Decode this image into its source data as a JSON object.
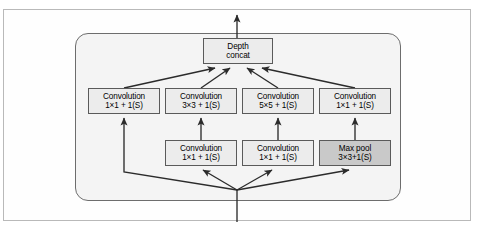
{
  "figure": {
    "colors": {
      "node_fill": "#ececec",
      "node_fill_dark": "#c9c9c9",
      "node_border": "#5a5a5a",
      "container_fill": "#f4f4f4",
      "container_border": "#6d6d6d",
      "frame_border": "#b9b9b9",
      "arrow": "#2b2b2b",
      "background": "#ffffff"
    }
  },
  "nodes": {
    "depth_concat": {
      "line1": "Depth",
      "line2": "concat",
      "style": "light"
    },
    "conv_1x1_a": {
      "line1": "Convolution",
      "line2": "1×1 + 1(S)",
      "style": "light"
    },
    "conv_3x3": {
      "line1": "Convolution",
      "line2": "3×3 + 1(S)",
      "style": "light"
    },
    "conv_5x5": {
      "line1": "Convolution",
      "line2": "5×5 + 1(S)",
      "style": "light"
    },
    "conv_1x1_b": {
      "line1": "Convolution",
      "line2": "1×1 + 1(S)",
      "style": "light"
    },
    "conv_1x1_c": {
      "line1": "Convolution",
      "line2": "1×1 + 1(S)",
      "style": "light"
    },
    "conv_1x1_d": {
      "line1": "Convolution",
      "line2": "1×1 + 1(S)",
      "style": "light"
    },
    "max_pool": {
      "line1": "Max pool",
      "line2": "3×3+1(S)",
      "style": "dark"
    }
  },
  "edges": [
    {
      "name": "input-to-junction",
      "from": "input",
      "to": "junction"
    },
    {
      "name": "junction-to-conv-1x1-a",
      "from": "junction",
      "to": "conv_1x1_a"
    },
    {
      "name": "junction-to-conv-1x1-c",
      "from": "junction",
      "to": "conv_1x1_c"
    },
    {
      "name": "junction-to-conv-1x1-d",
      "from": "junction",
      "to": "conv_1x1_d"
    },
    {
      "name": "junction-to-max-pool",
      "from": "junction",
      "to": "max_pool"
    },
    {
      "name": "conv-1x1-c-to-conv-3x3",
      "from": "conv_1x1_c",
      "to": "conv_3x3"
    },
    {
      "name": "conv-1x1-d-to-conv-5x5",
      "from": "conv_1x1_d",
      "to": "conv_5x5"
    },
    {
      "name": "max-pool-to-conv-1x1-b",
      "from": "max_pool",
      "to": "conv_1x1_b"
    },
    {
      "name": "conv-1x1-a-to-concat",
      "from": "conv_1x1_a",
      "to": "depth_concat"
    },
    {
      "name": "conv-3x3-to-concat",
      "from": "conv_3x3",
      "to": "depth_concat"
    },
    {
      "name": "conv-5x5-to-concat",
      "from": "conv_5x5",
      "to": "depth_concat"
    },
    {
      "name": "conv-1x1-b-to-concat",
      "from": "conv_1x1_b",
      "to": "depth_concat"
    },
    {
      "name": "concat-to-output",
      "from": "depth_concat",
      "to": "output"
    }
  ]
}
